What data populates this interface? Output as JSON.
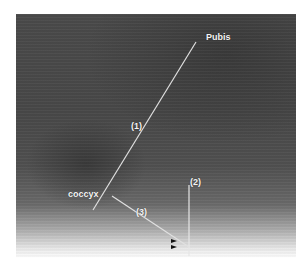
{
  "image": {
    "type": "ultrasound scan (grayscale)",
    "labels": {
      "pubis": "Pubis",
      "coccyx": "coccyx",
      "line1": "(1)",
      "line2": "(2)",
      "line3": "(3)"
    },
    "marker": "double arrowhead",
    "colors": {
      "line": "#e6e6e6",
      "label": "#f4f4f4",
      "marker": "#111111"
    }
  }
}
